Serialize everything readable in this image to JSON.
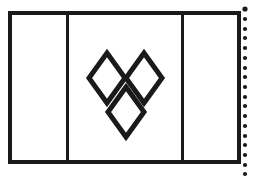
{
  "page": {
    "background_color": "#ffffff",
    "width": 255,
    "height": 177
  },
  "flag": {
    "name": "vertical-tricolor-flag-outline",
    "description": "Outline drawing of a vertical tricolour flag with three equal panels and a central emblem",
    "stroke_color": "#1a1a1a",
    "fill_color": "#ffffff",
    "border_stroke_width": 4,
    "divider_stroke_width": 3,
    "frame": {
      "x": 10,
      "y": 13,
      "width": 229,
      "height": 149
    },
    "panels": [
      {
        "name": "hoist-panel",
        "label": "left panel",
        "x": 10,
        "width": 57,
        "fill": "#ffffff"
      },
      {
        "name": "center-panel",
        "label": "center panel",
        "x": 67,
        "width": 115,
        "fill": "#ffffff"
      },
      {
        "name": "fly-panel",
        "label": "right panel",
        "x": 182,
        "width": 57,
        "fill": "#ffffff"
      }
    ],
    "dividers": [
      {
        "name": "divider-left",
        "x": 67
      },
      {
        "name": "divider-right",
        "x": 182
      }
    ],
    "emblem": {
      "name": "three-diamonds-emblem",
      "label": "three interlocking diamonds",
      "shape": "diamond",
      "count": 3,
      "stroke_color": "#1a1a1a",
      "stroke_width": 5,
      "fill": "none",
      "bounds": {
        "x": 89,
        "y": 53,
        "width": 73,
        "height": 85
      },
      "diamonds": [
        {
          "name": "diamond-upper-left",
          "cx": 107,
          "cy": 78,
          "rx": 18,
          "ry": 25
        },
        {
          "name": "diamond-upper-right",
          "cx": 144,
          "cy": 78,
          "rx": 18,
          "ry": 25
        },
        {
          "name": "diamond-lower-center",
          "cx": 126,
          "cy": 112,
          "rx": 18,
          "ry": 25
        }
      ]
    }
  },
  "perforation": {
    "name": "dotted-cut-line",
    "label": "dotted perforation line at right edge",
    "color": "#1a1a1a",
    "x": 245,
    "dot_radius": 2.1,
    "spacing": 9.8,
    "dot_count": 19,
    "start_y": 9
  }
}
